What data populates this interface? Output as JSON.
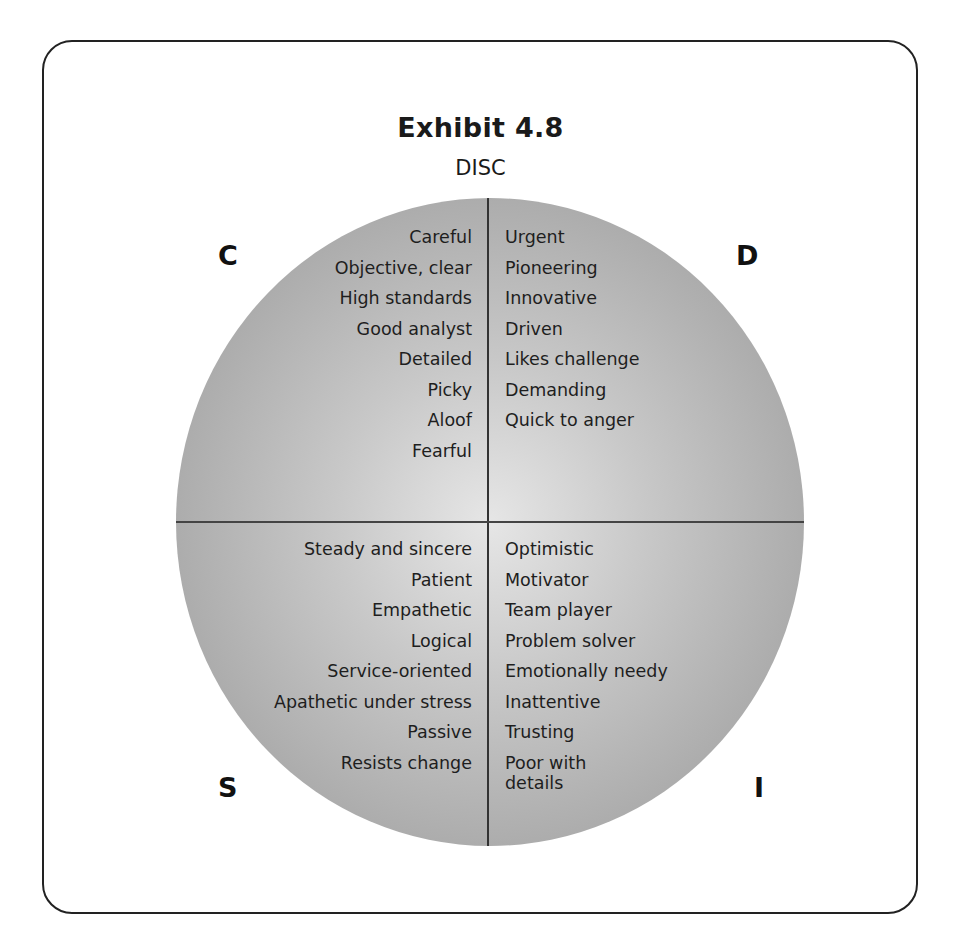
{
  "exhibit": {
    "title": "Exhibit 4.8",
    "subtitle": "DISC"
  },
  "quadrants": {
    "C": {
      "letter": "C",
      "traits": [
        "Careful",
        "Objective, clear",
        "High standards",
        "Good analyst",
        "Detailed",
        "Picky",
        "Aloof",
        "Fearful"
      ]
    },
    "D": {
      "letter": "D",
      "traits": [
        "Urgent",
        "Pioneering",
        "Innovative",
        "Driven",
        "Likes challenge",
        "Demanding",
        "Quick to anger"
      ]
    },
    "S": {
      "letter": "S",
      "traits": [
        "Steady and sincere",
        "Patient",
        "Empathetic",
        "Logical",
        "Service-oriented",
        "Apathetic under stress",
        "Passive",
        "Resists change"
      ]
    },
    "I": {
      "letter": "I",
      "traits": [
        "Optimistic",
        "Motivator",
        "Team player",
        "Problem solver",
        "Emotionally needy",
        "Inattentive",
        "Trusting",
        "Poor with details"
      ]
    }
  },
  "colors": {
    "circle_center": "#e6e6e6",
    "circle_edge": "#9c9c9c",
    "border": "#222222",
    "text": "#1a1a1a"
  }
}
